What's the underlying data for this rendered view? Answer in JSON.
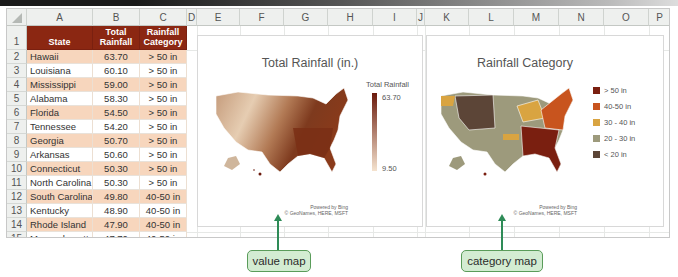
{
  "sheet": {
    "columns": [
      "A",
      "B",
      "C",
      "D",
      "E",
      "F",
      "G",
      "H",
      "I",
      "J",
      "K",
      "L",
      "M",
      "N",
      "O",
      "P"
    ],
    "rows": [
      "1",
      "2",
      "3",
      "4",
      "5",
      "6",
      "7",
      "8",
      "9",
      "10",
      "11",
      "12",
      "13",
      "14",
      "15"
    ],
    "table": {
      "headers": {
        "state": "State",
        "total_rainfall_line1": "Total",
        "total_rainfall_line2": "Rainfall",
        "category_line1": "Rainfall",
        "category_line2": "Category"
      },
      "data": [
        {
          "state": "Hawaii",
          "rainfall": "63.70",
          "category": "> 50 in"
        },
        {
          "state": "Louisiana",
          "rainfall": "60.10",
          "category": "> 50 in"
        },
        {
          "state": "Mississippi",
          "rainfall": "59.00",
          "category": "> 50 in"
        },
        {
          "state": "Alabama",
          "rainfall": "58.30",
          "category": "> 50 in"
        },
        {
          "state": "Florida",
          "rainfall": "54.50",
          "category": "> 50 in"
        },
        {
          "state": "Tennessee",
          "rainfall": "54.20",
          "category": "> 50 in"
        },
        {
          "state": "Georgia",
          "rainfall": "50.70",
          "category": "> 50 in"
        },
        {
          "state": "Arkansas",
          "rainfall": "50.60",
          "category": "> 50 in"
        },
        {
          "state": "Connecticut",
          "rainfall": "50.30",
          "category": "> 50 in"
        },
        {
          "state": "North Carolina",
          "rainfall": "50.30",
          "category": "> 50 in"
        },
        {
          "state": "South Carolina",
          "rainfall": "49.80",
          "category": "40-50 in"
        },
        {
          "state": "Kentucky",
          "rainfall": "48.90",
          "category": "40-50 in"
        },
        {
          "state": "Rhode Island",
          "rainfall": "47.90",
          "category": "40-50 in"
        },
        {
          "state": "Massachusetts",
          "rainfall": "47.70",
          "category": "40-50 in"
        }
      ]
    }
  },
  "value_map": {
    "title": "Total Rainfall (in.)",
    "legend_title": "Total Rainfall",
    "legend_max": "63.70",
    "legend_min": "9.50",
    "gradient_colors": [
      "#f5e3cf",
      "#6b1a0c"
    ],
    "attribution_line1": "Powered by Bing",
    "attribution_line2": "© GeoNames, HERE, MSFT"
  },
  "category_map": {
    "title": "Rainfall Category",
    "legend": [
      {
        "label": "> 50 in",
        "color": "#7a1f10"
      },
      {
        "label": "40-50 in",
        "color": "#c8541e"
      },
      {
        "label": "30 - 40 in",
        "color": "#d9a441"
      },
      {
        "label": "20 - 30 in",
        "color": "#9d9a7c"
      },
      {
        "label": "< 20 in",
        "color": "#5c4537"
      }
    ],
    "attribution_line1": "Powered by Bing",
    "attribution_line2": "© GeoNames, HERE, MSFT"
  },
  "callouts": {
    "value_map": "value map",
    "category_map": "category map"
  },
  "colors": {
    "header_fill": "#8b2712",
    "band_fill": "#f7d6bd",
    "callout_fill": "#d3ecd2",
    "arrow": "#2e8b57"
  }
}
